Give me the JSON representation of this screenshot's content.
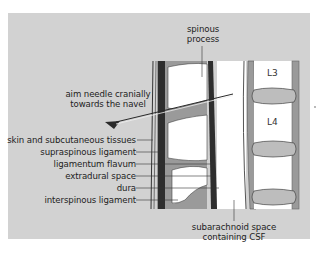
{
  "figure": {
    "type": "anatomical-diagram",
    "colors": {
      "background_panel": "#d2d2d2",
      "bone": "#ffffff",
      "ligament": "#9a9a9a",
      "ligamentum_flavum": "#2e2e2e",
      "disc": "#bdbdbd",
      "needle": "#2a2a2a"
    }
  },
  "labels": {
    "spinous_process": [
      "spinous",
      "process"
    ],
    "needle_instruction": [
      "aim needle cranially",
      "towards the navel"
    ],
    "left_column": [
      "skin and subcutaneous tissues",
      "supraspinous ligament",
      "ligamentum flavum",
      "extradural space",
      "dura",
      "interspinous ligament"
    ],
    "subarachnoid": [
      "subarachnoid space",
      "containing CSF"
    ],
    "vertebrae": [
      "L3",
      "L4"
    ]
  }
}
